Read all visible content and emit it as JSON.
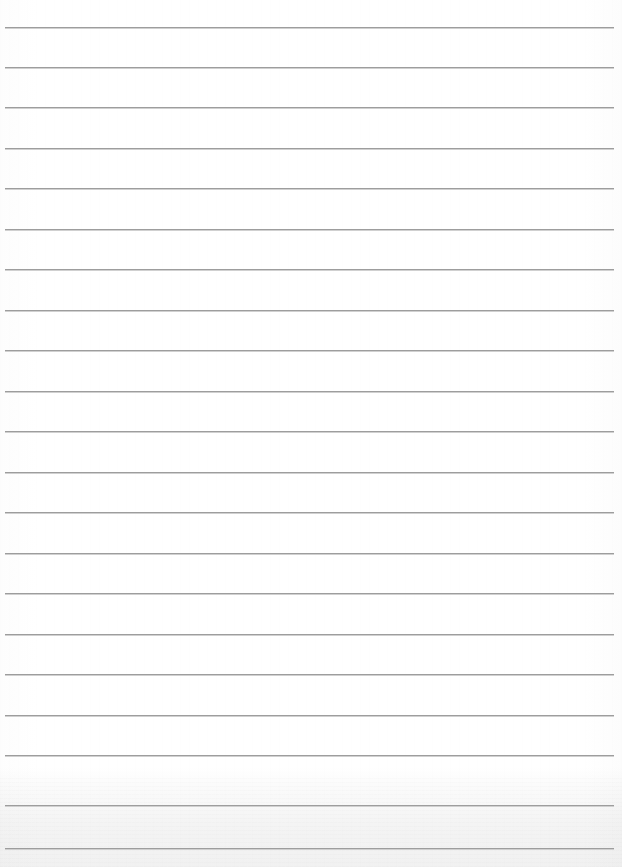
{
  "document": {
    "kind": "lined-paper-scan",
    "title": "Blank ruled notebook paper",
    "orientation": "portrait",
    "page_width": 622,
    "page_height": 867,
    "background_color": "#ffffff",
    "rule_color": "#9d9d9d",
    "rule_highlight_color": "#ffffff",
    "bottom_band_color": "#f1f1f1",
    "text_content": "",
    "has_handwriting": false,
    "has_printed_text": false,
    "margin_rule": "none"
  },
  "rules": {
    "count": 21,
    "left_x": 5,
    "right_x": 614,
    "thickness": 1,
    "spacing": 40.6,
    "y_positions": [
      27,
      67,
      107,
      148,
      188,
      229,
      269,
      310,
      350,
      391,
      431,
      472,
      512,
      553,
      593,
      634,
      674,
      715,
      755,
      805,
      848
    ]
  },
  "bottom_band": {
    "top_y": 778,
    "height": 89,
    "color": "#f1f1f1"
  }
}
